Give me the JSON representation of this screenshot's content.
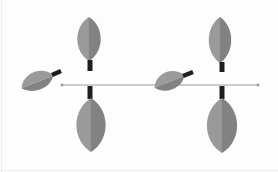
{
  "diagram": {
    "type": "leaf-arrangement",
    "colors": {
      "background": "#fdfdfd",
      "leaf_light": "#9a9a9a",
      "leaf_dark": "#828282",
      "midrib": "#8a8a8a",
      "petiole": "#1e1e1e",
      "axis_line": "#9c9c9c"
    },
    "axis": {
      "x1": 62,
      "x2": 258,
      "y": 85
    },
    "nodes": [
      {
        "id": "node-1",
        "x": 90,
        "upper_leaf": {
          "cx": 89,
          "top": 17,
          "bottom": 61,
          "width": 24,
          "stem_top": 60,
          "stem_bottom": 71
        },
        "lower_leaf": {
          "cx": 91,
          "top": 98,
          "bottom": 152,
          "width": 30,
          "stem_top": 86,
          "stem_bottom": 99
        },
        "side_leaf": {
          "cx": 37,
          "cy": 81,
          "rx": 17,
          "ry": 11,
          "rotate": -18,
          "stem_x1": 52,
          "stem_y1": 75,
          "stem_x2": 61,
          "stem_y2": 71
        }
      },
      {
        "id": "node-2",
        "x": 222,
        "upper_leaf": {
          "cx": 220,
          "top": 17,
          "bottom": 63,
          "width": 23,
          "stem_top": 62,
          "stem_bottom": 72
        },
        "lower_leaf": {
          "cx": 222,
          "top": 98,
          "bottom": 153,
          "width": 31,
          "stem_top": 86,
          "stem_bottom": 99
        },
        "side_leaf": {
          "cx": 169,
          "cy": 81,
          "rx": 16,
          "ry": 11,
          "rotate": -18,
          "stem_x1": 183,
          "stem_y1": 76,
          "stem_x2": 193,
          "stem_y2": 72
        }
      }
    ]
  }
}
